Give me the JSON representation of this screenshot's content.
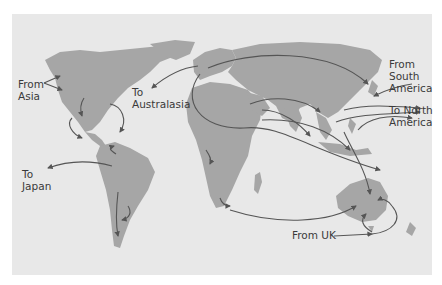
{
  "map": {
    "colors": {
      "background": "#ffffff",
      "ocean": "#e8e8e8",
      "land": "#a6a6a6",
      "arrow": "#555555",
      "text": "#3a3a3a"
    },
    "labels": [
      {
        "id": "from-asia",
        "lines": [
          "From",
          "Asia"
        ]
      },
      {
        "id": "to-australasia",
        "lines": [
          "To",
          "Australasia"
        ]
      },
      {
        "id": "from-south-america",
        "lines": [
          "From",
          "South",
          "America"
        ]
      },
      {
        "id": "to-north-america",
        "lines": [
          "To North",
          "America"
        ]
      },
      {
        "id": "to-japan",
        "lines": [
          "To",
          "Japan"
        ]
      },
      {
        "id": "from-uk",
        "lines": [
          "From UK"
        ]
      }
    ]
  }
}
